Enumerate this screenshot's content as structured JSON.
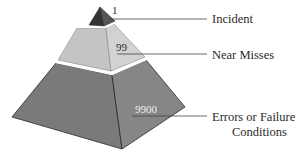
{
  "diagram": {
    "type": "pyramid",
    "title": "",
    "colors": {
      "top_left": "#3a3a3a",
      "top_right": "#5a5a5a",
      "middle_left": "#c6c6c6",
      "middle_right": "#d4d4d4",
      "bottom_left": "#7a7a7a",
      "bottom_right": "#858585",
      "edge": "#2a2a2a",
      "separator": "#ffffff",
      "leader_line": "#444444"
    },
    "tiers": [
      {
        "level": "top",
        "count": "1",
        "label": "Incident"
      },
      {
        "level": "middle",
        "count": "99",
        "label": "Near Misses"
      },
      {
        "level": "bottom",
        "count": "9900",
        "label_line1": "Errors or Failure",
        "label_line2": "Conditions"
      }
    ]
  }
}
